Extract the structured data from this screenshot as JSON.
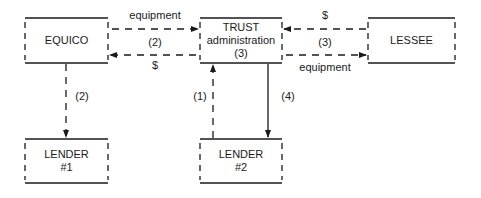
{
  "diagram": {
    "nodes": [
      {
        "id": "equico",
        "lines": [
          "EQUICO"
        ]
      },
      {
        "id": "trust",
        "lines": [
          "TRUST",
          "administration",
          "(3)"
        ]
      },
      {
        "id": "lessee",
        "lines": [
          "LESSEE"
        ]
      },
      {
        "id": "lender1",
        "lines": [
          "LENDER",
          "#1"
        ]
      },
      {
        "id": "lender2",
        "lines": [
          "LENDER",
          "#2"
        ]
      }
    ],
    "edges": [
      {
        "from": "equico",
        "to": "trust",
        "label": "equipment",
        "style": "dashed"
      },
      {
        "from": "trust",
        "to": "equico",
        "label": "$",
        "style": "dashed"
      },
      {
        "label_between": "(2)"
      },
      {
        "from": "lessee",
        "to": "trust",
        "label": "$",
        "style": "dashed"
      },
      {
        "from": "trust",
        "to": "lessee",
        "label": "equipment",
        "style": "dashed"
      },
      {
        "label_between": "(3)"
      },
      {
        "from": "equico",
        "to": "lender1",
        "label": "(2)",
        "style": "dashed"
      },
      {
        "from": "lender2",
        "to": "trust",
        "label": "(1)",
        "style": "dashed"
      },
      {
        "from": "trust",
        "to": "lender2",
        "label": "(4)",
        "style": "solid"
      }
    ]
  },
  "labels": {
    "equipment_top": "equipment",
    "dollar_left": "$",
    "step2_mid": "(2)",
    "dollar_right": "$",
    "equipment_bottom": "equipment",
    "step3_mid": "(3)",
    "step2_down": "(2)",
    "step1_up": "(1)",
    "step4_down": "(4)"
  }
}
